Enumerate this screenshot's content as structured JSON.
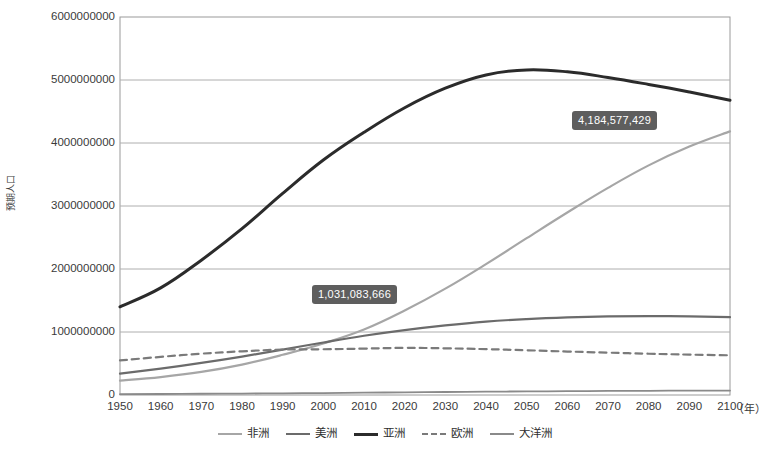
{
  "chart_data": {
    "type": "line",
    "title": "",
    "xlabel": "（年）",
    "ylabel": "预期人口",
    "xlim": [
      1950,
      2100
    ],
    "ylim": [
      0,
      6000000000
    ],
    "grid": true,
    "legend_position": "bottom",
    "x": [
      1950,
      1960,
      1970,
      1980,
      1990,
      2000,
      2010,
      2020,
      2030,
      2040,
      2050,
      2060,
      2070,
      2080,
      2090,
      2100
    ],
    "categories": [
      "1950",
      "1960",
      "1970",
      "1980",
      "1990",
      "2000",
      "2010",
      "2020",
      "2030",
      "2040",
      "2050",
      "2060",
      "2070",
      "2080",
      "2090",
      "2100"
    ],
    "yticks": [
      0,
      1000000000,
      2000000000,
      3000000000,
      4000000000,
      5000000000,
      6000000000
    ],
    "ytick_labels": [
      "0",
      "1000000000",
      "2000000000",
      "3000000000",
      "4000000000",
      "5000000000",
      "6000000000"
    ],
    "series": [
      {
        "name": "非洲",
        "color": "#a6a6a6",
        "style": "solid",
        "width": 2.2,
        "values": [
          228000000,
          285000000,
          366000000,
          482000000,
          638000000,
          818000000,
          1039000000,
          1341000000,
          1688000000,
          2077000000,
          2489000000,
          2897000000,
          3288000000,
          3645000000,
          3943000000,
          4184577429
        ]
      },
      {
        "name": "美洲",
        "color": "#6b6b6b",
        "style": "solid",
        "width": 2.2,
        "values": [
          340000000,
          420000000,
          510000000,
          610000000,
          720000000,
          834000000,
          940000000,
          1030000000,
          1105000000,
          1165000000,
          1205000000,
          1232000000,
          1248000000,
          1253000000,
          1248000000,
          1235000000
        ]
      },
      {
        "name": "亚洲",
        "color": "#2b2b2b",
        "style": "solid",
        "width": 3.0,
        "values": [
          1400000000,
          1700000000,
          2140000000,
          2640000000,
          3200000000,
          3730000000,
          4170000000,
          4560000000,
          4870000000,
          5080000000,
          5160000000,
          5130000000,
          5040000000,
          4930000000,
          4810000000,
          4680000000
        ]
      },
      {
        "name": "欧洲",
        "color": "#7a7a7a",
        "style": "dashed",
        "width": 2.2,
        "values": [
          549000000,
          605000000,
          656000000,
          693000000,
          721000000,
          726000000,
          736000000,
          748000000,
          741000000,
          728000000,
          710000000,
          690000000,
          672000000,
          655000000,
          641000000,
          630000000
        ]
      },
      {
        "name": "大洋洲",
        "color": "#8a8a8a",
        "style": "solid",
        "width": 1.8,
        "values": [
          13000000,
          16000000,
          20000000,
          23000000,
          27000000,
          31000000,
          37000000,
          43000000,
          48000000,
          53000000,
          57000000,
          61000000,
          64000000,
          67000000,
          69000000,
          71000000
        ]
      }
    ],
    "annotations": [
      {
        "label": "1,031,083,666",
        "series": "非洲",
        "x": 2010,
        "y": 1031083666,
        "box_left": 313,
        "box_top": 286
      },
      {
        "label": "4,184,577,429",
        "series": "非洲",
        "x": 2100,
        "y": 4184577429,
        "box_left": 573,
        "box_top": 112
      }
    ]
  },
  "plot": {
    "left": 120,
    "right": 730,
    "top": 17,
    "bottom": 395,
    "border_color": "#9a9a9a",
    "grid_color": "#aeaeae",
    "background": "#ffffff"
  }
}
